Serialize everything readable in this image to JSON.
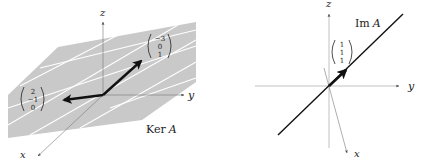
{
  "figures": [
    {
      "id": "kernel",
      "label": "Ker A",
      "label_roman": "Ker",
      "label_italic": "A",
      "axes": {
        "x": "x",
        "y": "y",
        "z": "z"
      },
      "vectors": [
        {
          "name": "v1",
          "entries": [
            "−3",
            "0",
            "1"
          ]
        },
        {
          "name": "v2",
          "entries": [
            "2",
            "−1",
            "0"
          ]
        }
      ],
      "plane_color": "#c8c8c8",
      "grid_color": "#ffffff"
    },
    {
      "id": "image",
      "label": "Im A",
      "label_roman": "Im",
      "label_italic": "A",
      "axes": {
        "x": "x",
        "y": "y",
        "z": "z"
      },
      "vectors": [
        {
          "name": "v1",
          "entries": [
            "1",
            "1",
            "1"
          ]
        }
      ],
      "line_color": "#111111"
    }
  ]
}
